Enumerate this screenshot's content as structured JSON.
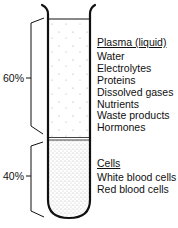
{
  "diagram": {
    "plasma": {
      "heading": "Plasma (liquid)",
      "percent": "60%",
      "items": [
        "Water",
        "Electrolytes",
        "Proteins",
        "Dissolved gases",
        "Nutrients",
        "Waste products",
        "Hormones"
      ]
    },
    "cells": {
      "heading": "Cells",
      "percent": "40%",
      "items": [
        "White blood cells",
        "Red blood cells"
      ]
    },
    "colors": {
      "stroke": "#111111",
      "background": "#ffffff"
    }
  }
}
